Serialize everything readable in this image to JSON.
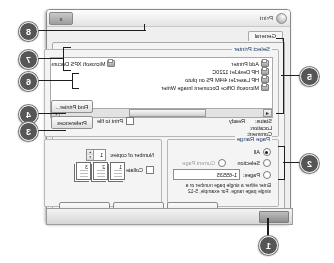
{
  "window": {
    "title": "Print",
    "icon": "printer-icon",
    "close_label": "x",
    "tab": "General"
  },
  "taskbar": {
    "item_label": ""
  },
  "groups": {
    "select_printer": "Select Printer",
    "page_range": "Page Range",
    "copies": ""
  },
  "printers": [
    {
      "name": "Add Printer",
      "icon": "printer-icon"
    },
    {
      "name": "HP DeskJet 1220C",
      "icon": "printer-icon"
    },
    {
      "name": "HP LaserJet 4/4M PS on pluto",
      "icon": "printer-icon"
    },
    {
      "name": "Microsoft Office Document Image Writer",
      "icon": "printer-icon"
    },
    {
      "name": "Microsoft XPS Document",
      "icon": "printer-icon"
    }
  ],
  "scrollbar": {
    "left_arrow": "◄",
    "right_arrow": "►"
  },
  "status": {
    "status_label": "Status:",
    "status_value": "Ready",
    "location_label": "Location:",
    "location_value": "",
    "comment_label": "Comment:",
    "comment_value": ""
  },
  "buttons": {
    "preferences": "Preferences",
    "find_printer": "Find Printer...",
    "print": "Print",
    "cancel": "Cancel",
    "apply": "Apply"
  },
  "checkboxes": {
    "print_to_file": "Print to file",
    "collate": "Collate"
  },
  "page_range": {
    "all": "All",
    "selection": "Selection",
    "current_page": "Current Page",
    "pages": "Pages:",
    "pages_value": "1-65535",
    "hint": "Enter either a single page number or a single page range.  For example, 5-12"
  },
  "copies": {
    "label": "Number of copies:",
    "value": "1",
    "spin_up": "▲",
    "spin_down": "▼",
    "collate_pages": [
      "1",
      "2",
      "3"
    ]
  },
  "callouts": [
    {
      "n": "1"
    },
    {
      "n": "2"
    },
    {
      "n": "3"
    },
    {
      "n": "4"
    },
    {
      "n": "5"
    },
    {
      "n": "6"
    },
    {
      "n": "7"
    },
    {
      "n": "8"
    }
  ]
}
